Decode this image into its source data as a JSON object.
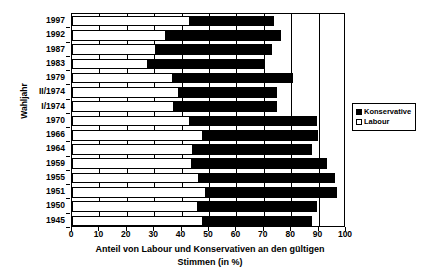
{
  "chart_data": {
    "type": "bar",
    "orientation": "horizontal",
    "stacked": true,
    "title": "",
    "xlabel": "Anteil von Labour und Konservativen an den gültigen Stimmen (in %)",
    "xlabel_line1": "Anteil von Labour und Konservativen an den gültigen",
    "xlabel_line2": "Stimmen (in %)",
    "ylabel": "Wahljahr",
    "xlim": [
      0,
      100
    ],
    "xticks": [
      0,
      10,
      20,
      30,
      40,
      50,
      60,
      70,
      80,
      90,
      100
    ],
    "grid": true,
    "legend_position": "right-middle",
    "categories": [
      "1997",
      "1992",
      "1987",
      "1983",
      "1979",
      "II/1974",
      "I/1974",
      "1970",
      "1966",
      "1964",
      "1959",
      "1955",
      "1951",
      "1950",
      "1945"
    ],
    "series": [
      {
        "name": "Labour",
        "color": "#ffffff",
        "values": [
          43.2,
          34.4,
          30.8,
          27.6,
          36.9,
          39.2,
          37.1,
          43.0,
          47.9,
          44.1,
          43.8,
          46.4,
          48.8,
          46.1,
          47.7
        ]
      },
      {
        "name": "Konservative",
        "color": "#000000",
        "values": [
          30.7,
          41.9,
          42.3,
          42.4,
          43.9,
          35.8,
          37.9,
          46.4,
          41.9,
          43.4,
          49.4,
          49.7,
          48.0,
          43.4,
          39.8
        ]
      }
    ],
    "totals": [
      73.9,
      76.3,
      73.1,
      70.0,
      80.8,
      75.0,
      75.0,
      89.4,
      89.8,
      87.5,
      93.2,
      96.1,
      96.8,
      89.5,
      87.5
    ]
  },
  "legend": {
    "entries": [
      {
        "label": "Konservative",
        "swatch": "filled-black-square"
      },
      {
        "label": "Labour",
        "swatch": "empty-white-square"
      }
    ]
  },
  "colors": {
    "konservative": "#000000",
    "labour": "#ffffff",
    "axis": "#000000",
    "background": "#ffffff"
  }
}
